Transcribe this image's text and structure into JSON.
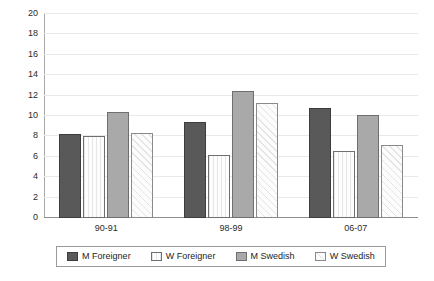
{
  "chart_data": {
    "type": "bar",
    "title": "",
    "subtitle": "",
    "xlabel": "",
    "ylabel": "",
    "ylim": [
      0,
      20
    ],
    "yticks": [
      0,
      2,
      4,
      6,
      8,
      10,
      12,
      14,
      16,
      18,
      20
    ],
    "grid": true,
    "legend_position": "bottom",
    "categories": [
      "90-91",
      "98-99",
      "06-07"
    ],
    "series": [
      {
        "name": "M Foreigner",
        "color": "#595959",
        "pattern": "solid-dark",
        "values": [
          8.2,
          9.4,
          10.8
        ]
      },
      {
        "name": "W Foreigner",
        "color": "#fdfdfd",
        "pattern": "vertical-lines",
        "values": [
          8.0,
          6.2,
          6.6
        ]
      },
      {
        "name": "M Swedish",
        "color": "#a9a9a9",
        "pattern": "solid-gray",
        "values": [
          10.4,
          12.5,
          10.1
        ]
      },
      {
        "name": "W Swedish",
        "color": "#fcfcfc",
        "pattern": "diagonal-hatch",
        "values": [
          8.3,
          11.3,
          7.2
        ]
      }
    ]
  },
  "legend": {
    "items": [
      {
        "label": "M Foreigner"
      },
      {
        "label": "W Foreigner"
      },
      {
        "label": "M Swedish"
      },
      {
        "label": "W Swedish"
      }
    ]
  }
}
